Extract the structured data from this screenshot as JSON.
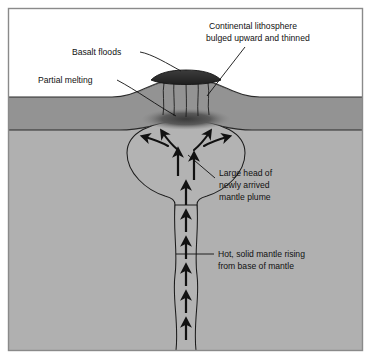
{
  "figure": {
    "frame_color": "#8a8a8a",
    "background_color": "#ffffff"
  },
  "layers": {
    "sky": {
      "name": "air",
      "color": "#ffffff"
    },
    "lithosphere": {
      "name": "Continental lithosphere",
      "color": "#939393"
    },
    "mantle": {
      "name": "Mantle",
      "color": "#b0b0b0"
    },
    "basalt": {
      "name": "Basalt floods",
      "color": "#2d2d2d"
    },
    "melt_zone": {
      "name": "Partial melting zone",
      "color": "#4a4a4a"
    },
    "plume": {
      "name": "Mantle plume",
      "color": "#b3b3b3"
    },
    "outline_color": "#1c1c1c"
  },
  "labels": [
    {
      "id": "basalt-floods",
      "lines": [
        "Basalt floods"
      ],
      "x": 72,
      "y": 55,
      "anchor": "start"
    },
    {
      "id": "partial-melting",
      "lines": [
        "Partial melting"
      ],
      "x": 38,
      "y": 83,
      "anchor": "start"
    },
    {
      "id": "continental-lithosphere",
      "lines": [
        "Continental lithosphere",
        "bulged upward and thinned"
      ],
      "x": 209,
      "y": 29,
      "anchor": "start"
    },
    {
      "id": "mantle-plume-head",
      "lines": [
        "Large head of",
        "newly arrived",
        "mantle plume"
      ],
      "x": 219,
      "y": 172,
      "anchor": "start"
    },
    {
      "id": "hot-solid-mantle",
      "lines": [
        "Hot, solid mantle rising",
        "from base of mantle"
      ],
      "x": 218,
      "y": 252,
      "anchor": "start"
    }
  ],
  "label_text": {
    "basalt_floods": "Basalt floods",
    "partial_melting": "Partial melting",
    "continental_lithosphere_l1": "Continental lithosphere",
    "continental_lithosphere_l2": "bulged upward and thinned",
    "plume_head_l1": "Large head of",
    "plume_head_l2": "newly arrived",
    "plume_head_l3": "mantle plume",
    "hot_mantle_l1": "Hot, solid mantle rising",
    "hot_mantle_l2": "from base of mantle"
  },
  "arrows": {
    "conduit_upward_count": 6,
    "plume_center_upward_count": 3,
    "plume_fan_curved_count": 4,
    "direction": "upward"
  }
}
